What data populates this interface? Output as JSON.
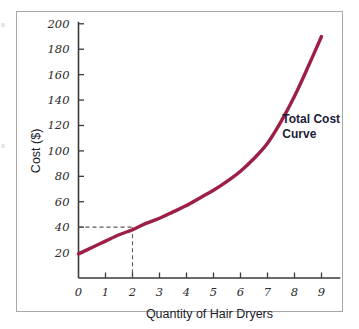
{
  "figure": {
    "frame_color": "#a8a8a8",
    "background": "#ffffff"
  },
  "chart_data": {
    "type": "line",
    "title": "",
    "subtitle": "",
    "xlabel": "Quantity of Hair Dryers",
    "ylabel": "Cost ($)",
    "xlim": [
      0,
      9.7
    ],
    "ylim": [
      0,
      200
    ],
    "grid": false,
    "legend_position": "inline-annotation",
    "series": [
      {
        "name": "Total Cost Curve",
        "color": "#9e1f45",
        "x": [
          0,
          0.5,
          1,
          1.5,
          2,
          2.5,
          3,
          3.5,
          4,
          4.5,
          5,
          5.5,
          6,
          6.5,
          7,
          7.5,
          8,
          8.5,
          9
        ],
        "values": [
          19,
          24,
          29,
          34,
          38,
          43,
          47,
          52,
          57,
          63,
          69,
          76,
          84,
          94,
          106,
          123,
          143,
          166,
          190
        ]
      }
    ],
    "x_ticks": [
      0,
      1,
      2,
      3,
      4,
      5,
      6,
      7,
      8,
      9
    ],
    "x_tick_labels": [
      "0",
      "1",
      "2",
      "3",
      "4",
      "5",
      "6",
      "7",
      "8",
      "9"
    ],
    "y_ticks": [
      20,
      40,
      60,
      80,
      100,
      120,
      140,
      160,
      180,
      200
    ],
    "y_tick_labels": [
      "20",
      "40",
      "60",
      "80",
      "100",
      "120",
      "140",
      "160",
      "180",
      "200"
    ],
    "annotations": [
      {
        "name": "total-cost-curve-label",
        "line1": "Total Cost",
        "line2": "Curve",
        "x": 7.55,
        "y": 122
      }
    ],
    "guide_lines": [
      {
        "name": "cost-guide",
        "style": "dashed",
        "from_axis": "y",
        "value": 40,
        "to_x": 2
      },
      {
        "name": "quantity-guide",
        "style": "dashed",
        "from_axis": "x",
        "value": 2,
        "to_y": 40
      }
    ]
  }
}
